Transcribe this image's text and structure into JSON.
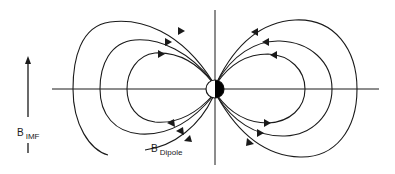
{
  "diagram": {
    "labels": {
      "imf": {
        "main": "B",
        "sub": "IMF"
      },
      "dipole": {
        "main": "B",
        "sub": "Dipole"
      }
    },
    "colors": {
      "line": "#1a1a1a",
      "background": "#ffffff",
      "dipole_dark_half": "#000000",
      "dipole_light_half": "#ffffff"
    },
    "axes": {
      "horizontal": {
        "y": 89,
        "x_start": 52,
        "x_end": 379
      },
      "vertical": {
        "x": 215,
        "y_start": 10,
        "y_end": 165
      }
    },
    "dipole": {
      "cx": 215,
      "cy": 89,
      "r": 9,
      "filled_side": "right"
    },
    "field_loops": {
      "left_axis_crossings_x": [
        73,
        100,
        127
      ],
      "right_axis_crossings_x": [
        357,
        332,
        305
      ],
      "arrow_directions": {
        "upper_left": "toward-dipole",
        "upper_right": "away-from-dipole",
        "lower_left": "away-from-dipole",
        "lower_right": "toward-dipole"
      }
    },
    "imf_arrow": {
      "x": 28,
      "tip_y": 57,
      "tail_y": 117,
      "direction": "up"
    }
  }
}
